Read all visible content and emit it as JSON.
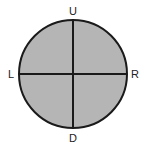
{
  "diagram": {
    "type": "circle-with-crosshair",
    "labels": {
      "up": "U",
      "down": "D",
      "left": "L",
      "right": "R"
    },
    "colors": {
      "fill": "#b5b5b5",
      "stroke": "#1a1a1a",
      "background": "#ffffff"
    }
  }
}
